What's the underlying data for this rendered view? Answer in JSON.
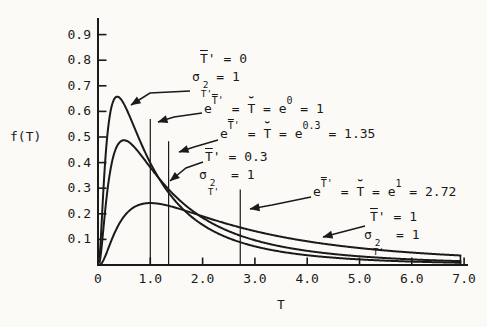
{
  "figure": {
    "ylabel": "f(T)",
    "xlabel": "T",
    "background": "#fbfaf6",
    "ink": "#1a1a1a"
  },
  "axes": {
    "xtick_labels": [
      "0",
      "1.0",
      "2.0",
      "3.0",
      "4.0",
      "5.0",
      "6.0",
      "7.0"
    ],
    "ytick_labels": [
      "0.1",
      "0.2",
      "0.3",
      "0.4",
      "0.5",
      "0.6",
      "0.7",
      "0.8",
      "0.9"
    ]
  },
  "annotations": {
    "mu0": {
      "t": "T",
      "rest": "' = 0",
      "sigma": "σ",
      "sup": "2",
      "sub": "T'",
      "eq": "= 1",
      "leader": [
        [
          190,
          91
        ],
        [
          150,
          93
        ],
        [
          131,
          105
        ]
      ]
    },
    "e0": {
      "base": "e",
      "sup_t": "T",
      "sup_r": "'",
      "mid1": " = ",
      "breve": "˘",
      "tck": "T",
      "mid2": " = e",
      "sup2": "0",
      "tail": " = 1",
      "leader": [
        [
          202,
          113
        ],
        [
          174,
          117
        ],
        [
          158,
          122
        ]
      ]
    },
    "e03": {
      "base": "e",
      "sup_t": "T",
      "sup_r": "'",
      "mid1": " = ",
      "breve": "˘",
      "tck": "T",
      "mid2": " = e",
      "sup2": "0.3",
      "tail": " = 1.35",
      "leader": [
        [
          218,
          140
        ],
        [
          194,
          147
        ],
        [
          179,
          152
        ]
      ]
    },
    "mu03": {
      "t": "T",
      "rest": "' = 0.3",
      "sigma": "σ",
      "sup": "2",
      "sub": "T'",
      "eq": " = 1",
      "leader": [
        [
          203,
          162
        ],
        [
          186,
          168
        ],
        [
          170,
          181
        ]
      ]
    },
    "e1": {
      "base": "e",
      "sup_t": "T",
      "sup_r": "'",
      "mid1": " = ",
      "breve": "˘",
      "tck": "T",
      "mid2": " = e",
      "sup2": "1",
      "tail": " = 2.72",
      "leader": [
        [
          311,
          197
        ],
        [
          272,
          205
        ],
        [
          250,
          209
        ]
      ]
    },
    "mu1": {
      "t": "T",
      "rest": "' = 1",
      "sigma": "σ",
      "sup": "2",
      "sub": "T'",
      "eq": " = 1",
      "leader": [
        [
          365,
          226
        ],
        [
          342,
          232
        ],
        [
          323,
          237
        ]
      ]
    }
  },
  "chart_data": {
    "type": "line",
    "title": "",
    "xlabel": "T",
    "ylabel": "f(T)",
    "xlim": [
      0,
      7.05
    ],
    "ylim": [
      0,
      0.95
    ],
    "xticks": [
      0,
      1.0,
      2.0,
      3.0,
      4.0,
      5.0,
      6.0,
      7.0
    ],
    "yticks": [
      0.1,
      0.2,
      0.3,
      0.4,
      0.5,
      0.6,
      0.7,
      0.8,
      0.9
    ],
    "grid": false,
    "model": "lognormal_pdf",
    "sample_T": [
      0.1,
      0.25,
      0.37,
      0.5,
      0.75,
      1.0,
      1.35,
      1.5,
      2.0,
      2.72,
      3.0,
      4.0,
      5.0,
      6.0,
      7.0
    ],
    "series": [
      {
        "name": "T'bar = 0, sigma2 = 1",
        "mu": 0,
        "sigma2": 1,
        "median": 1.0,
        "values": [
          0.282,
          0.61,
          0.658,
          0.627,
          0.51,
          0.399,
          0.283,
          0.245,
          0.157,
          0.089,
          0.073,
          0.038,
          0.022,
          0.013,
          0.009
        ]
      },
      {
        "name": "T'bar = 0.3, sigma2 = 1",
        "mu": 0.3,
        "sigma2": 1,
        "median": 1.35,
        "values": [
          0.135,
          0.385,
          0.467,
          0.487,
          0.448,
          0.381,
          0.296,
          0.264,
          0.185,
          0.115,
          0.097,
          0.055,
          0.034,
          0.022,
          0.015
        ]
      },
      {
        "name": "T'bar = 1, sigma2 = 1",
        "mu": 1,
        "sigma2": 1,
        "median": 2.72,
        "values": [
          0.017,
          0.093,
          0.148,
          0.19,
          0.232,
          0.242,
          0.231,
          0.223,
          0.19,
          0.147,
          0.132,
          0.093,
          0.066,
          0.049,
          0.036
        ]
      }
    ],
    "vlines": [
      {
        "x": 1.0,
        "top": 0.57
      },
      {
        "x": 1.35,
        "top": 0.483
      },
      {
        "x": 2.72,
        "top": 0.295
      }
    ]
  }
}
